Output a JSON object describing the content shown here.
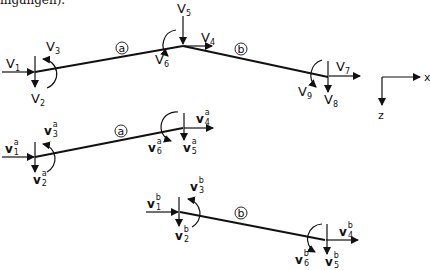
{
  "caption": "ingangen).",
  "axes": {
    "x_label": "x",
    "z_label": "z"
  },
  "global_structure": {
    "element_labels": [
      "a",
      "b"
    ],
    "dofs": [
      {
        "name": "V",
        "sub": "1"
      },
      {
        "name": "V",
        "sub": "2"
      },
      {
        "name": "V",
        "sub": "3"
      },
      {
        "name": "V",
        "sub": "4"
      },
      {
        "name": "V",
        "sub": "5"
      },
      {
        "name": "V",
        "sub": "6"
      },
      {
        "name": "V",
        "sub": "7"
      },
      {
        "name": "V",
        "sub": "8"
      },
      {
        "name": "V",
        "sub": "9"
      }
    ]
  },
  "element_a": {
    "label": "a",
    "dofs": [
      {
        "name": "v",
        "sub": "1",
        "sup": "a"
      },
      {
        "name": "v",
        "sub": "2",
        "sup": "a"
      },
      {
        "name": "v",
        "sub": "3",
        "sup": "a"
      },
      {
        "name": "v",
        "sub": "4",
        "sup": "a"
      },
      {
        "name": "v",
        "sub": "5",
        "sup": "a"
      },
      {
        "name": "v",
        "sub": "6",
        "sup": "a"
      }
    ]
  },
  "element_b": {
    "label": "b",
    "dofs": [
      {
        "name": "v",
        "sub": "1",
        "sup": "b"
      },
      {
        "name": "v",
        "sub": "2",
        "sup": "b"
      },
      {
        "name": "v",
        "sub": "3",
        "sup": "b"
      },
      {
        "name": "v",
        "sub": "4",
        "sup": "b"
      },
      {
        "name": "v",
        "sub": "5",
        "sup": "b"
      },
      {
        "name": "v",
        "sub": "6",
        "sup": "b"
      }
    ]
  }
}
